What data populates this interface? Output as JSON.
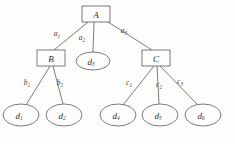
{
  "diagram": {
    "type": "tree",
    "background_color": "#fdfdfb",
    "stroke_color": "#5a5a5a",
    "text_color": "#2b2b2b",
    "nodes": [
      {
        "id": "A",
        "label": "A",
        "shape": "rect",
        "cx": 96,
        "cy": 14,
        "w": 28,
        "h": 16,
        "level": 0
      },
      {
        "id": "B",
        "label": "B",
        "shape": "rect",
        "cx": 51,
        "cy": 58,
        "w": 28,
        "h": 16,
        "level": 1
      },
      {
        "id": "d3",
        "label": "d",
        "sub": "3",
        "shape": "ellipse",
        "cx": 93,
        "cy": 61,
        "rx": 17,
        "ry": 9,
        "level": 1
      },
      {
        "id": "C",
        "label": "C",
        "shape": "rect",
        "cx": 156,
        "cy": 58,
        "w": 28,
        "h": 16,
        "level": 1
      },
      {
        "id": "d1",
        "label": "d",
        "sub": "1",
        "shape": "ellipse",
        "cx": 21,
        "cy": 115,
        "rx": 18,
        "ry": 11,
        "level": 2
      },
      {
        "id": "d2",
        "label": "d",
        "sub": "2",
        "shape": "ellipse",
        "cx": 64,
        "cy": 115,
        "rx": 18,
        "ry": 11,
        "level": 2
      },
      {
        "id": "d4",
        "label": "d",
        "sub": "4",
        "shape": "ellipse",
        "cx": 118,
        "cy": 115,
        "rx": 18,
        "ry": 11,
        "level": 2
      },
      {
        "id": "d5",
        "label": "d",
        "sub": "5",
        "shape": "ellipse",
        "cx": 160,
        "cy": 115,
        "rx": 18,
        "ry": 11,
        "level": 2
      },
      {
        "id": "d6",
        "label": "d",
        "sub": "6",
        "shape": "ellipse",
        "cx": 203,
        "cy": 115,
        "rx": 18,
        "ry": 11,
        "level": 2
      }
    ],
    "edges": [
      {
        "id": "a1",
        "from": "A",
        "to": "B",
        "label": "a",
        "sub": "1",
        "x1": 88,
        "y1": 22,
        "x2": 54,
        "y2": 50,
        "lx": 57,
        "ly": 36
      },
      {
        "id": "a2",
        "from": "A",
        "to": "d3",
        "label": "a",
        "sub": "2",
        "x1": 94,
        "y1": 22,
        "x2": 93,
        "y2": 52,
        "lx": 82,
        "ly": 40
      },
      {
        "id": "a3",
        "from": "A",
        "to": "C",
        "label": "a",
        "sub": "3",
        "x1": 108,
        "y1": 22,
        "x2": 152,
        "y2": 50,
        "lx": 124,
        "ly": 33
      },
      {
        "id": "b1",
        "from": "B",
        "to": "d1",
        "label": "b",
        "sub": "1",
        "x1": 50,
        "y1": 66,
        "x2": 26,
        "y2": 105,
        "lx": 27,
        "ly": 85
      },
      {
        "id": "b2",
        "from": "B",
        "to": "d2",
        "label": "b",
        "sub": "2",
        "x1": 53,
        "y1": 66,
        "x2": 63,
        "y2": 104,
        "lx": 60,
        "ly": 85
      },
      {
        "id": "c1",
        "from": "C",
        "to": "d4",
        "label": "c",
        "sub": "1",
        "x1": 154,
        "y1": 66,
        "x2": 123,
        "y2": 105,
        "lx": 129,
        "ly": 85
      },
      {
        "id": "c2",
        "from": "C",
        "to": "d5",
        "label": "c",
        "sub": "2",
        "x1": 157,
        "y1": 66,
        "x2": 159,
        "y2": 104,
        "lx": 159,
        "ly": 87
      },
      {
        "id": "c3",
        "from": "C",
        "to": "d6",
        "label": "c",
        "sub": "3",
        "x1": 160,
        "y1": 66,
        "x2": 198,
        "y2": 105,
        "lx": 180,
        "ly": 84
      }
    ]
  }
}
